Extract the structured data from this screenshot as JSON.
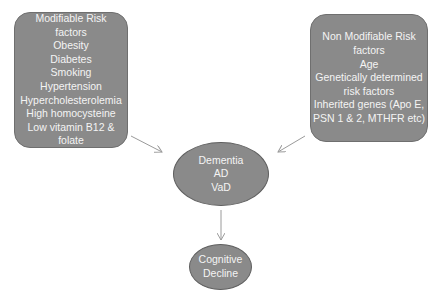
{
  "diagram": {
    "modifiable_box": {
      "lines": [
        "Modifiable Risk",
        "factors",
        "Obesity",
        "Diabetes",
        "Smoking",
        "Hypertension",
        "Hypercholesterolemia",
        "High homocysteine",
        "Low vitamin  B12 &",
        "folate"
      ]
    },
    "non_modifiable_box": {
      "lines": [
        "Non Modifiable Risk",
        "factors",
        "Age",
        "Genetically determined",
        "risk factors",
        "Inherited genes (Apo E,",
        "PSN 1 & 2,  MTHFR etc)"
      ]
    },
    "dementia_node": {
      "lines": [
        "Dementia",
        "AD",
        "VaD"
      ]
    },
    "cognitive_node": {
      "lines": [
        "Cognitive",
        "Decline"
      ]
    },
    "edges": [
      {
        "from": "modifiable_box",
        "to": "dementia_node"
      },
      {
        "from": "non_modifiable_box",
        "to": "dementia_node"
      },
      {
        "from": "dementia_node",
        "to": "cognitive_node"
      }
    ],
    "colors": {
      "node_fill": "#8a8a8a",
      "node_text": "#f4f4f4",
      "arrow": "#9a9a9a"
    }
  }
}
